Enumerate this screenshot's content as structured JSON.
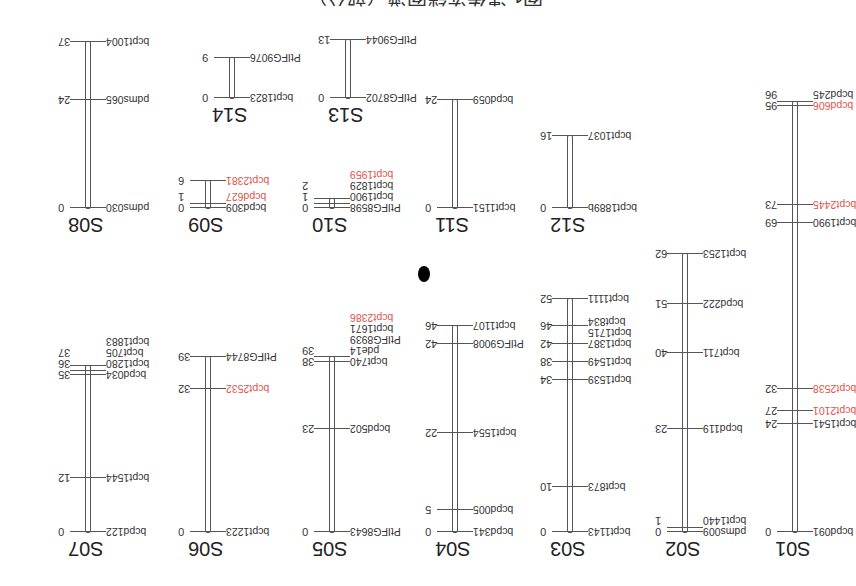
{
  "figure": {
    "title": "图1 遗传连锁图谱（部分）",
    "orientation": "rotated 180 degrees",
    "marker_note": "red markers highlighted"
  },
  "colors": {
    "marker_default": "#333333",
    "marker_highlight": "#e0544a",
    "bar": "#555555"
  },
  "linkage_groups": [
    {
      "name": "S01",
      "markers": [
        {
          "pos": 0,
          "name": "bcpd091",
          "red": false
        },
        {
          "pos": 24,
          "name": "bcpt1541",
          "red": false
        },
        {
          "pos": 27,
          "name": "bcpt2101",
          "red": true
        },
        {
          "pos": 32,
          "name": "bcpt2538",
          "red": true
        },
        {
          "pos": 69,
          "name": "bcpt1990",
          "red": false
        },
        {
          "pos": 73,
          "name": "bcpt2445",
          "red": true
        },
        {
          "pos": 95,
          "name": "bcpd606",
          "red": true
        },
        {
          "pos": 96,
          "name": "bcpd245",
          "red": false
        }
      ]
    },
    {
      "name": "S02",
      "markers": [
        {
          "pos": 0,
          "name": "pdms009",
          "red": false
        },
        {
          "pos": 1,
          "name": "bcpt1440",
          "red": false
        },
        {
          "pos": 23,
          "name": "bcpd119",
          "red": false
        },
        {
          "pos": 40,
          "name": "bcpt711",
          "red": false
        },
        {
          "pos": 51,
          "name": "bcpd222",
          "red": false
        },
        {
          "pos": 62,
          "name": "bcpt1253",
          "red": false
        }
      ]
    },
    {
      "name": "S03",
      "markers": [
        {
          "pos": 0,
          "name": "bcpt1143",
          "red": false
        },
        {
          "pos": 10,
          "name": "bcpt873",
          "red": false
        },
        {
          "pos": 34,
          "name": "bcpt1539",
          "red": false
        },
        {
          "pos": 38,
          "name": "bcpt1549",
          "red": false
        },
        {
          "pos": 42,
          "name": "bcpt1387",
          "red": false
        },
        {
          "pos": 42,
          "name": "bcpt1715",
          "red": false
        },
        {
          "pos": 46,
          "name": "bcpt834",
          "red": false
        },
        {
          "pos": 52,
          "name": "bcpt1111",
          "red": false
        }
      ]
    },
    {
      "name": "S04",
      "markers": [
        {
          "pos": 0,
          "name": "bcpd341",
          "red": false
        },
        {
          "pos": 5,
          "name": "bcpd005",
          "red": false
        },
        {
          "pos": 22,
          "name": "bcpt1554",
          "red": false
        },
        {
          "pos": 42,
          "name": "PtIFG9008",
          "red": false
        },
        {
          "pos": 46,
          "name": "bcpt1107",
          "red": false
        }
      ]
    },
    {
      "name": "S05",
      "markers": [
        {
          "pos": 0,
          "name": "PtIFG8643",
          "red": false
        },
        {
          "pos": 23,
          "name": "bcpd502",
          "red": false
        },
        {
          "pos": 38,
          "name": "bcpt740",
          "red": false
        },
        {
          "pos": 38,
          "name": "pde14",
          "red": false
        },
        {
          "pos": 38,
          "name": "PtIFG8939",
          "red": false
        },
        {
          "pos": 39,
          "name": "bcpt1671",
          "red": false
        },
        {
          "pos": 39,
          "name": "bcpt2386",
          "red": true
        }
      ]
    },
    {
      "name": "S06",
      "markers": [
        {
          "pos": 0,
          "name": "bcpt1223",
          "red": false
        },
        {
          "pos": 32,
          "name": "bcpt2532",
          "red": true
        },
        {
          "pos": 39,
          "name": "PtIFG8744",
          "red": false
        }
      ]
    },
    {
      "name": "S07",
      "markers": [
        {
          "pos": 0,
          "name": "bcpd122",
          "red": false
        },
        {
          "pos": 12,
          "name": "bcpt1544",
          "red": false
        },
        {
          "pos": 35,
          "name": "bcpd034",
          "red": false
        },
        {
          "pos": 36,
          "name": "bcpt1280",
          "red": false
        },
        {
          "pos": 37,
          "name": "bcpt705",
          "red": false
        },
        {
          "pos": 37,
          "name": "bcpt1883",
          "red": false
        }
      ]
    },
    {
      "name": "S08",
      "markers": [
        {
          "pos": 0,
          "name": "pdms030",
          "red": false
        },
        {
          "pos": 24,
          "name": "pdms065",
          "red": false
        },
        {
          "pos": 37,
          "name": "bcpt1004",
          "red": false
        }
      ]
    },
    {
      "name": "S09",
      "markers": [
        {
          "pos": 0,
          "name": "bcpd309",
          "red": false
        },
        {
          "pos": 1,
          "name": "bcpd627",
          "red": true
        },
        {
          "pos": 6,
          "name": "bcpt2381",
          "red": true
        }
      ]
    },
    {
      "name": "S10",
      "markers": [
        {
          "pos": 0,
          "name": "PtIFG8598",
          "red": false
        },
        {
          "pos": 1,
          "name": "bcpt1900",
          "red": false
        },
        {
          "pos": 1,
          "name": "bcpt1829",
          "red": false
        },
        {
          "pos": 2,
          "name": "bcpt1959",
          "red": true
        }
      ]
    },
    {
      "name": "S11",
      "markers": [
        {
          "pos": 0,
          "name": "bcpt1151",
          "red": false
        },
        {
          "pos": 24,
          "name": "bcpd059",
          "red": false
        }
      ]
    },
    {
      "name": "S12",
      "markers": [
        {
          "pos": 0,
          "name": "bcpt1889b",
          "red": false
        },
        {
          "pos": 16,
          "name": "bcpt1037",
          "red": false
        }
      ]
    },
    {
      "name": "S13",
      "markers": [
        {
          "pos": 0,
          "name": "PtIFG8702",
          "red": false
        },
        {
          "pos": 13,
          "name": "PtIFG9044",
          "red": false
        }
      ]
    },
    {
      "name": "S14",
      "markers": [
        {
          "pos": 0,
          "name": "bcpt1823",
          "red": false
        },
        {
          "pos": 9,
          "name": "PtIFG9076",
          "red": false
        }
      ]
    }
  ]
}
